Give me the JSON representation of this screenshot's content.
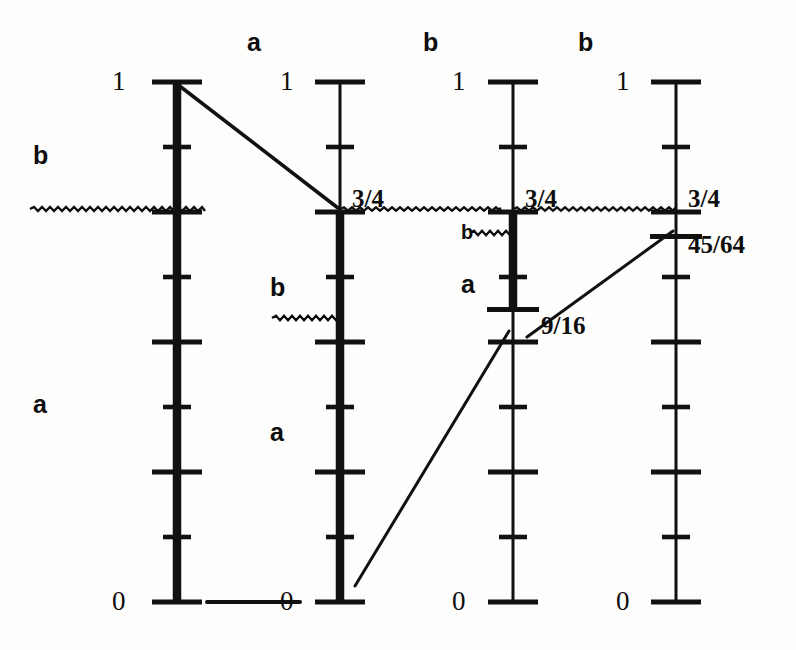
{
  "figure": {
    "background_color": "#fdfdfc",
    "ink_color": "#111111",
    "width": 796,
    "height": 650
  },
  "axes": [
    {
      "id": "axis-1",
      "x": 177,
      "top_y": 82,
      "bottom_y": 602,
      "top_label": "1",
      "bottom_label": "0",
      "mid_label": "",
      "extra_label": "",
      "divisions": 8,
      "bold_from": 1.0,
      "bold_to": 0.0
    },
    {
      "id": "axis-2",
      "x": 340,
      "top_y": 82,
      "bottom_y": 602,
      "top_label": "1",
      "bottom_label": "0",
      "mid_label": "3/4",
      "extra_label": "",
      "divisions": 8,
      "bold_from": 0.75,
      "bold_to": 0.0
    },
    {
      "id": "axis-3",
      "x": 513,
      "top_y": 82,
      "bottom_y": 602,
      "top_label": "1",
      "bottom_label": "0",
      "mid_label": "3/4",
      "extra_label": "9/16",
      "divisions": 8,
      "bold_from": 0.75,
      "bold_to": 0.5625
    },
    {
      "id": "axis-4",
      "x": 676,
      "top_y": 82,
      "bottom_y": 602,
      "top_label": "1",
      "bottom_label": "0",
      "mid_label": "3/4",
      "extra_label": "45/64",
      "divisions": 8,
      "bold_from": null,
      "bold_to": null
    }
  ],
  "top_labels": [
    {
      "text": "a",
      "x": 247,
      "y": 30
    },
    {
      "text": "b",
      "x": 423,
      "y": 30
    },
    {
      "text": "b",
      "x": 578,
      "y": 30
    }
  ],
  "side_labels": [
    {
      "text": "b",
      "x": 33,
      "y": 143,
      "size": "large"
    },
    {
      "text": "a",
      "x": 33,
      "y": 392,
      "size": "large"
    },
    {
      "text": "b",
      "x": 270,
      "y": 275,
      "size": "large"
    },
    {
      "text": "a",
      "x": 270,
      "y": 420,
      "size": "large"
    },
    {
      "text": "b",
      "x": 461,
      "y": 222,
      "size": "small"
    },
    {
      "text": "a",
      "x": 461,
      "y": 272,
      "size": "large"
    }
  ],
  "value_labels": [
    {
      "text": "1",
      "x": 112,
      "y": 68,
      "kind": "endpoint"
    },
    {
      "text": "0",
      "x": 112,
      "y": 588,
      "kind": "endpoint"
    },
    {
      "text": "1",
      "x": 280,
      "y": 68,
      "kind": "endpoint"
    },
    {
      "text": "0",
      "x": 280,
      "y": 588,
      "kind": "endpoint"
    },
    {
      "text": "3/4",
      "x": 352,
      "y": 186,
      "kind": "fraction"
    },
    {
      "text": "1",
      "x": 452,
      "y": 68,
      "kind": "endpoint"
    },
    {
      "text": "0",
      "x": 452,
      "y": 588,
      "kind": "endpoint"
    },
    {
      "text": "3/4",
      "x": 525,
      "y": 186,
      "kind": "fraction"
    },
    {
      "text": "9/16",
      "x": 541,
      "y": 313,
      "kind": "fraction"
    },
    {
      "text": "1",
      "x": 616,
      "y": 68,
      "kind": "endpoint"
    },
    {
      "text": "0",
      "x": 616,
      "y": 588,
      "kind": "endpoint"
    },
    {
      "text": "3/4",
      "x": 688,
      "y": 186,
      "kind": "fraction"
    },
    {
      "text": "45/64",
      "x": 688,
      "y": 232,
      "kind": "fraction"
    }
  ],
  "connector_lines": [
    {
      "id": "map-1-to-2",
      "x1": 177,
      "y1": 84,
      "x2": 338,
      "y2": 208,
      "width": 3.6
    },
    {
      "id": "map-2-to-3",
      "x1": 355,
      "y1": 586,
      "x2": 509,
      "y2": 331,
      "width": 3.0
    },
    {
      "id": "map-3-to-4",
      "x1": 527,
      "y1": 337,
      "x2": 673,
      "y2": 231,
      "width": 3.0
    },
    {
      "id": "baseline-1-to-2",
      "x1": 207,
      "y1": 602,
      "x2": 300,
      "y2": 602,
      "width": 4.0
    }
  ],
  "wavy_lines": [
    {
      "id": "wavy-left-3-4",
      "x1": 30,
      "x2": 205,
      "y": 209,
      "amp": 2.0
    },
    {
      "id": "wavy-a2-3-4",
      "x1": 340,
      "x2": 500,
      "y": 209,
      "amp": 1.6
    },
    {
      "id": "wavy-a3-3-4",
      "x1": 513,
      "x2": 676,
      "y": 209,
      "amp": 1.6
    },
    {
      "id": "wavy-mid-b",
      "x1": 272,
      "x2": 340,
      "y": 318,
      "amp": 2.2
    },
    {
      "id": "wavy-axis3-b",
      "x1": 470,
      "x2": 513,
      "y": 233,
      "amp": 2.2
    }
  ],
  "chart_data": {
    "type": "line",
    "x": [
      "axis-1",
      "axis-2",
      "axis-3",
      "axis-4"
    ],
    "marked_values": [
      1,
      0.75,
      0.5625,
      0.703125
    ],
    "marked_labels": [
      "1",
      "3/4",
      "9/16",
      "45/64"
    ],
    "secondary_values": [
      null,
      null,
      0.75,
      0.75
    ],
    "secondary_labels": [
      null,
      null,
      "3/4",
      "3/4"
    ],
    "bold_segments": [
      {
        "axis": "axis-1",
        "from": 0.0,
        "to": 1.0
      },
      {
        "axis": "axis-2",
        "from": 0.0,
        "to": 0.75
      },
      {
        "axis": "axis-3",
        "from": 0.5625,
        "to": 0.75
      }
    ],
    "branch_labels": [
      "a",
      "b",
      "b"
    ],
    "ylim": [
      0,
      1
    ],
    "ytick_count": 9,
    "grid": false,
    "legend": "none"
  }
}
